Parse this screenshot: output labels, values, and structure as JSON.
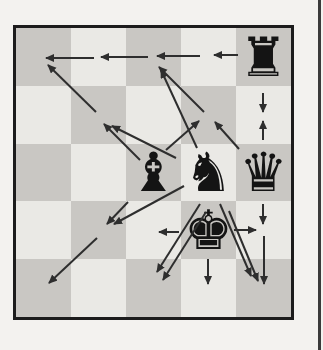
{
  "diagram": {
    "type": "chess-move-diagram",
    "page_background": "#f3f2ef",
    "page_edge_color": "#3a3a3a",
    "page_edge_x": 318,
    "board": {
      "cols": 5,
      "rows": 5,
      "square_w": 55,
      "square_h": 57.8,
      "origin_x": 16,
      "origin_y": 28,
      "light_color": "#eae9e5",
      "dark_color": "#c9c7c3",
      "border_color": "#1c1c1c",
      "piece_color": "#141414"
    },
    "pieces": [
      {
        "name": "black-rook",
        "glyph": "♜",
        "col": 5,
        "row": 1
      },
      {
        "name": "black-bishop",
        "glyph": "♝",
        "col": 3,
        "row": 3
      },
      {
        "name": "black-knight",
        "glyph": "♞",
        "col": 4,
        "row": 3
      },
      {
        "name": "black-queen",
        "glyph": "♛",
        "col": 5,
        "row": 3
      },
      {
        "name": "black-king",
        "glyph": "♚",
        "col": 4,
        "row": 4
      }
    ],
    "arrow_color": "#2e2e2e",
    "arrow_stroke_width": 2,
    "arrows": [
      {
        "name": "rook-left-1",
        "from": [
          238,
          55
        ],
        "to": [
          214,
          55
        ]
      },
      {
        "name": "rook-left-2",
        "from": [
          200,
          56
        ],
        "to": [
          157,
          56
        ]
      },
      {
        "name": "rook-left-3",
        "from": [
          148,
          57
        ],
        "to": [
          101,
          57
        ]
      },
      {
        "name": "rook-left-4",
        "from": [
          94,
          58
        ],
        "to": [
          46,
          58
        ]
      },
      {
        "name": "rook-down",
        "from": [
          263,
          93
        ],
        "to": [
          263,
          112
        ]
      },
      {
        "name": "queen-up",
        "from": [
          263,
          140
        ],
        "to": [
          263,
          121
        ]
      },
      {
        "name": "queen-up-left-1",
        "from": [
          239,
          149
        ],
        "to": [
          215,
          122
        ]
      },
      {
        "name": "queen-up-left-2",
        "from": [
          204,
          112
        ],
        "to": [
          159,
          67
        ]
      },
      {
        "name": "queen-down-1",
        "from": [
          263,
          204
        ],
        "to": [
          263,
          224
        ]
      },
      {
        "name": "queen-down-2",
        "from": [
          264,
          236
        ],
        "to": [
          264,
          284
        ]
      },
      {
        "name": "bishop-up-right",
        "from": [
          166,
          150
        ],
        "to": [
          199,
          121
        ]
      },
      {
        "name": "bishop-up-left-1",
        "from": [
          140,
          160
        ],
        "to": [
          104,
          124
        ]
      },
      {
        "name": "bishop-up-left-2",
        "from": [
          96,
          112
        ],
        "to": [
          48,
          65
        ]
      },
      {
        "name": "bishop-down-left-1",
        "from": [
          128,
          202
        ],
        "to": [
          107,
          224
        ]
      },
      {
        "name": "bishop-down-left-2",
        "from": [
          97,
          238
        ],
        "to": [
          49,
          283
        ]
      },
      {
        "name": "knight-to-c3r1",
        "from": [
          197,
          148
        ],
        "to": [
          161,
          70
        ]
      },
      {
        "name": "knight-to-c2r2",
        "from": [
          176,
          158
        ],
        "to": [
          112,
          126
        ]
      },
      {
        "name": "knight-to-c2r4",
        "from": [
          184,
          186
        ],
        "to": [
          114,
          224
        ]
      },
      {
        "name": "knight-to-c3r5",
        "from": [
          200,
          204
        ],
        "to": [
          157,
          272
        ]
      },
      {
        "name": "knight-to-c5r5",
        "from": [
          220,
          204
        ],
        "to": [
          251,
          276
        ]
      },
      {
        "name": "king-left",
        "from": [
          179,
          232
        ],
        "to": [
          159,
          232
        ]
      },
      {
        "name": "king-right",
        "from": [
          234,
          230
        ],
        "to": [
          256,
          230
        ]
      },
      {
        "name": "king-down",
        "from": [
          208,
          259
        ],
        "to": [
          208,
          284
        ]
      },
      {
        "name": "king-down-left",
        "from": [
          206,
          212
        ],
        "to": [
          163,
          280
        ]
      },
      {
        "name": "king-down-right",
        "from": [
          229,
          211
        ],
        "to": [
          258,
          281
        ]
      }
    ]
  }
}
